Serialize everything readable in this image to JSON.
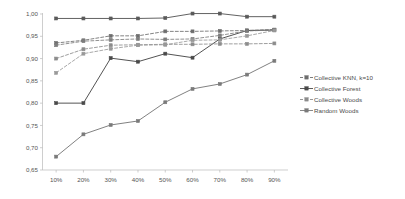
{
  "chart_data": {
    "type": "line",
    "title": "",
    "xlabel": "",
    "ylabel": "",
    "categories": [
      "10%",
      "20%",
      "30%",
      "40%",
      "50%",
      "60%",
      "70%",
      "80%",
      "90%"
    ],
    "ylim": [
      0.65,
      1.0
    ],
    "ytick_labels": [
      "1,00",
      "0,95",
      "0,90",
      "0,85",
      "0,80",
      "0,75",
      "0,70",
      "0,65"
    ],
    "ytick_values": [
      1.0,
      0.95,
      0.9,
      0.85,
      0.8,
      0.75,
      0.7,
      0.65
    ],
    "grid": false,
    "legend_position": "right",
    "series": [
      {
        "name": "Collective KNN, k=10",
        "style": "dashed",
        "color": "#6e6e6e",
        "values": [
          0.935,
          0.941,
          0.951,
          0.951,
          0.961,
          0.961,
          0.962,
          0.963,
          0.965
        ]
      },
      {
        "name": "Collective Forest",
        "style": "solid",
        "color": "#4a4a4a",
        "values": [
          0.8,
          0.8,
          0.901,
          0.893,
          0.911,
          0.902,
          0.944,
          0.963,
          0.964
        ]
      },
      {
        "name": "Collective Woods",
        "style": "dashed",
        "color": "#8c8c8c",
        "values": [
          0.9,
          0.921,
          0.93,
          0.931,
          0.932,
          0.932,
          0.933,
          0.933,
          0.934
        ]
      },
      {
        "name": "Random Woods",
        "style": "solid",
        "color": "#7a7a7a",
        "values": [
          0.68,
          0.73,
          0.751,
          0.76,
          0.802,
          0.832,
          0.843,
          0.864,
          0.895
        ]
      },
      {
        "name": "Collective KNN top",
        "style": "solid",
        "color": "#5a5a5a",
        "values": [
          0.99,
          0.99,
          0.99,
          0.99,
          0.991,
          1.001,
          1.001,
          0.994,
          0.994
        ]
      },
      {
        "name": "Collective Woods upper",
        "style": "dashed",
        "color": "#7d7d7d",
        "values": [
          0.93,
          0.939,
          0.942,
          0.944,
          0.943,
          0.944,
          0.952,
          0.962,
          0.964
        ]
      },
      {
        "name": "Collective KNN lower",
        "style": "dashed",
        "color": "#999999",
        "values": [
          0.868,
          0.911,
          0.922,
          0.93,
          0.931,
          0.941,
          0.942,
          0.951,
          0.963
        ]
      }
    ]
  },
  "legend": {
    "entries": [
      {
        "label": "Collective KNN, k=10"
      },
      {
        "label": "Collective Forest"
      },
      {
        "label": "Collective Woods"
      },
      {
        "label": "Random Woods"
      }
    ]
  }
}
